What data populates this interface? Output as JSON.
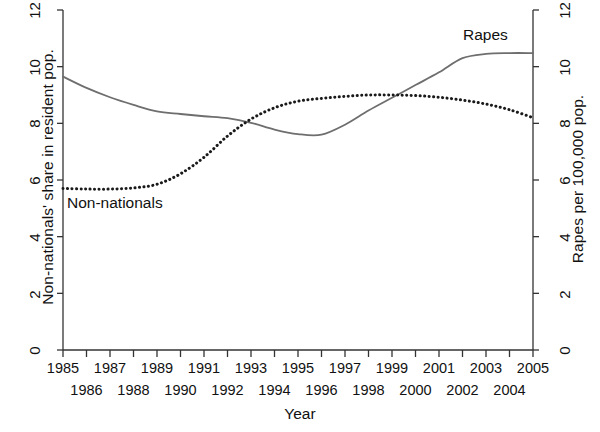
{
  "chart_data": {
    "type": "line",
    "title": "",
    "subtitle": "",
    "xlabel": "Year",
    "ylabel": "Non-nationals' share in resident pop.",
    "ylabel_right": "Rapes per 100,000 pop.",
    "ylim": [
      0,
      12
    ],
    "ylim_right": [
      0,
      12
    ],
    "yticks": [
      0,
      2,
      4,
      6,
      8,
      10,
      12
    ],
    "yticks_right": [
      0,
      2,
      4,
      6,
      8,
      10,
      12
    ],
    "grid": false,
    "legend_position": "inline-annotations",
    "xlim": [
      1985,
      2005
    ],
    "x": [
      1985,
      1986,
      1987,
      1988,
      1989,
      1990,
      1991,
      1992,
      1993,
      1994,
      1995,
      1996,
      1997,
      1998,
      1999,
      2000,
      2001,
      2002,
      2003,
      2004,
      2005
    ],
    "xticks": [
      1985,
      1986,
      1987,
      1988,
      1989,
      1990,
      1991,
      1992,
      1993,
      1994,
      1995,
      1996,
      1997,
      1998,
      1999,
      2000,
      2001,
      2002,
      2003,
      2004,
      2005
    ],
    "xticks_row1": [
      1985,
      1987,
      1989,
      1991,
      1993,
      1995,
      1997,
      1999,
      2001,
      2003,
      2005
    ],
    "xticks_row2": [
      1986,
      1988,
      1990,
      1992,
      1994,
      1996,
      1998,
      2000,
      2002,
      2004
    ],
    "series": [
      {
        "name": "Rapes",
        "axis": "right",
        "style": "solid",
        "color": "#6e6e6e",
        "values": [
          9.65,
          9.25,
          8.92,
          8.65,
          8.42,
          8.33,
          8.25,
          8.18,
          8.02,
          7.78,
          7.62,
          7.6,
          7.95,
          8.45,
          8.9,
          9.35,
          9.8,
          10.3,
          10.45,
          10.48,
          10.48
        ]
      },
      {
        "name": "Non-nationals",
        "axis": "left",
        "style": "dotted",
        "color": "#1a1a1a",
        "values": [
          5.7,
          5.68,
          5.68,
          5.72,
          5.85,
          6.22,
          6.8,
          7.55,
          8.15,
          8.55,
          8.78,
          8.88,
          8.95,
          9.0,
          9.0,
          8.98,
          8.92,
          8.82,
          8.68,
          8.48,
          8.2
        ]
      }
    ],
    "annotations": [
      {
        "text": "Rapes",
        "x": 2002,
        "y": 11.1
      },
      {
        "text": "Non-nationals",
        "x": 1986.2,
        "y": 5.05
      }
    ]
  },
  "figure": {
    "background": "#ffffff",
    "axis_color": "#333333"
  }
}
